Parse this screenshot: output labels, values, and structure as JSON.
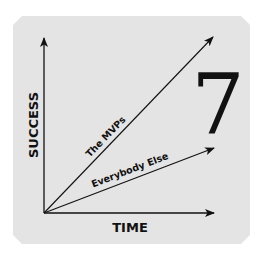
{
  "diagram": {
    "y_axis_label": "SUCCESS",
    "x_axis_label": "TIME",
    "big_number": "7",
    "series": [
      {
        "name": "The MVPs",
        "from": [
          44,
          213
        ],
        "to": [
          213,
          37
        ]
      },
      {
        "name": "Everybody Else",
        "from": [
          44,
          213
        ],
        "to": [
          214,
          148
        ]
      }
    ],
    "colors": {
      "background": "#ffffff",
      "panel": "#e4e4e4",
      "ink": "#111111"
    }
  }
}
